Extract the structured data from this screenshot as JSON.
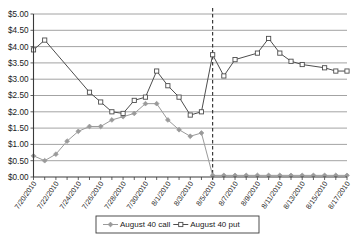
{
  "chart_data": {
    "type": "line",
    "title": "",
    "xlabel": "",
    "ylabel": "",
    "ylim": [
      0,
      5
    ],
    "ytick_step": 0.5,
    "ytick_labels": [
      "$0.00",
      "$0.50",
      "$1.00",
      "$1.50",
      "$2.00",
      "$2.50",
      "$3.00",
      "$3.50",
      "$4.00",
      "$4.50",
      "$5.00"
    ],
    "grid": true,
    "legend_position": "bottom-center",
    "x": [
      "7/20/2010",
      "7/21/2010",
      "7/22/2010",
      "7/23/2010",
      "7/24/2010",
      "7/25/2010",
      "7/26/2010",
      "7/27/2010",
      "7/28/2010",
      "7/29/2010",
      "7/30/2010",
      "7/31/2010",
      "8/1/2010",
      "8/2/2010",
      "8/3/2010",
      "8/4/2010",
      "8/5/2010",
      "8/6/2010",
      "8/7/2010",
      "8/8/2010",
      "8/9/2010",
      "8/10/2010",
      "8/11/2010",
      "8/12/2010",
      "8/13/2010",
      "8/14/2010",
      "8/15/2010",
      "8/16/2010",
      "8/17/2010"
    ],
    "xtick_labels_shown": [
      "7/20/2010",
      "7/22/2010",
      "7/24/2010",
      "7/26/2010",
      "7/28/2010",
      "7/30/2010",
      "8/1/2010",
      "8/3/2010",
      "8/5/2010",
      "8/7/2010",
      "8/9/2010",
      "8/11/2010",
      "8/13/2010",
      "8/15/2010",
      "8/17/2010"
    ],
    "series": [
      {
        "name": "August 40 call",
        "marker": "diamond",
        "color": "#9a9a9a",
        "values": [
          0.65,
          0.5,
          0.7,
          1.1,
          1.4,
          1.55,
          1.55,
          1.75,
          1.85,
          1.95,
          2.25,
          2.25,
          1.75,
          1.45,
          1.25,
          1.35,
          0.05,
          0.05,
          0.05,
          0.05,
          0.05,
          0.05,
          0.05,
          0.05,
          0.05,
          0.05,
          0.05,
          0.05,
          0.05
        ]
      },
      {
        "name": "August 40 put",
        "marker": "square",
        "color": "#4d4d4d",
        "values": [
          3.9,
          4.2,
          null,
          null,
          null,
          2.6,
          2.3,
          2.0,
          1.95,
          2.35,
          2.45,
          3.25,
          2.8,
          2.45,
          1.9,
          2.0,
          3.75,
          3.1,
          3.6,
          null,
          3.8,
          4.25,
          3.8,
          3.55,
          3.45,
          null,
          3.35,
          3.25,
          3.25
        ]
      }
    ],
    "annotations": [
      {
        "type": "vertical-dashed-line",
        "at": "8/5/2010"
      }
    ]
  },
  "legend": {
    "items": [
      {
        "label": "August 40 call",
        "marker": "diamond"
      },
      {
        "label": "August 40 put",
        "marker": "square"
      }
    ]
  }
}
